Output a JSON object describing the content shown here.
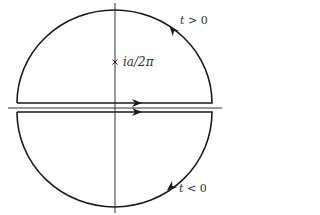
{
  "figure": {
    "type": "contour-integral-diagram",
    "labels": {
      "upper_region": {
        "var": "t",
        "rel": ">",
        "val": "0"
      },
      "lower_region": {
        "var": "t",
        "rel": "<",
        "val": "0"
      },
      "pole": {
        "text": "ia/2π",
        "marker": "×"
      }
    },
    "axes": {
      "horizontal": {
        "x1": 8,
        "x2": 222,
        "y": 108
      },
      "vertical": {
        "x": 115,
        "y1": 3,
        "y2": 213
      }
    },
    "upper_contour": {
      "flat_y": 103,
      "left_x": 17,
      "right_x": 212,
      "center_x": 115,
      "radius_x": 97.5,
      "radius_y": 93,
      "orientation": "counterclockwise"
    },
    "lower_contour": {
      "flat_y": 112,
      "left_x": 17,
      "right_x": 212,
      "center_x": 115,
      "radius_x": 97.5,
      "radius_y": 95,
      "orientation": "clockwise"
    },
    "colors": {
      "stroke": "#1a1a1a",
      "axis": "#333333",
      "text": "#333333"
    }
  }
}
